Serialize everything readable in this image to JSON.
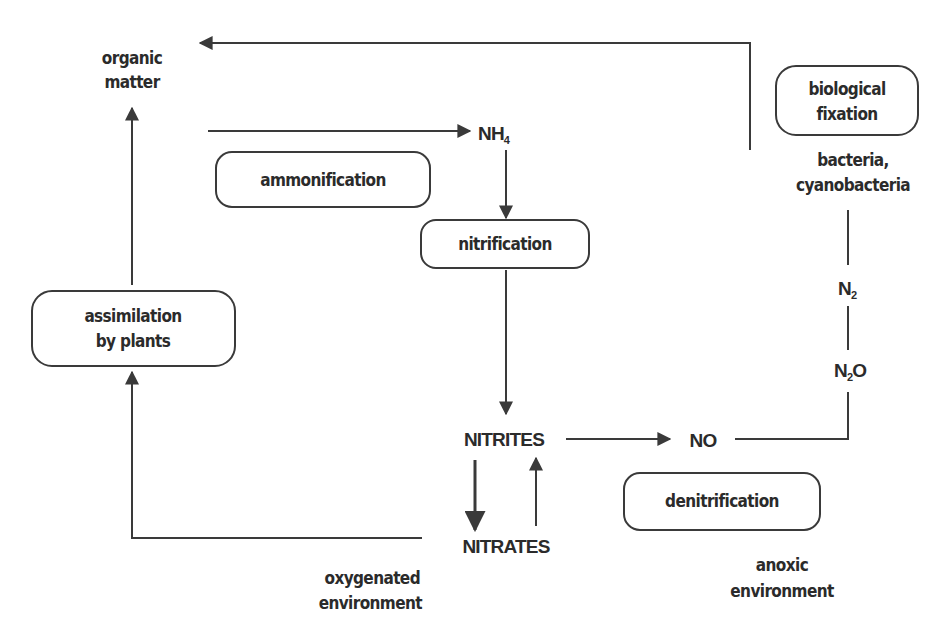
{
  "diagram": {
    "type": "nitrogen-cycle",
    "colors": {
      "ink": "#2b2b2b",
      "line": "#3a3a3a",
      "background": "#ffffff"
    },
    "nodes": {
      "organic_matter": {
        "line1": "organic",
        "line2": "matter"
      },
      "nh4": {
        "base": "NH",
        "subscript": "4"
      },
      "nitrites": {
        "label": "NITRITES"
      },
      "nitrates": {
        "label": "NITRATES"
      },
      "no": {
        "label": "NO"
      },
      "n2o": {
        "base": "N",
        "subscript": "2",
        "suffix": "O"
      },
      "n2": {
        "base": "N",
        "subscript": "2"
      },
      "bacteria": {
        "line1": "bacteria,",
        "line2": "cyanobacteria"
      }
    },
    "processes": {
      "ammonification": {
        "label": "ammonification"
      },
      "nitrification": {
        "label": "nitrification"
      },
      "assimilation": {
        "line1": "assimilation",
        "line2": "by plants"
      },
      "biological_fixation": {
        "line1": "biological",
        "line2": "fixation"
      },
      "denitrification": {
        "label": "denitrification"
      }
    },
    "environments": {
      "oxygenated": {
        "line1": "oxygenated",
        "line2": "environment"
      },
      "anoxic": {
        "line1": "anoxic",
        "line2": "environment"
      }
    },
    "edges": [
      {
        "from": "organic_matter",
        "to": "nh4",
        "via": "ammonification"
      },
      {
        "from": "nh4",
        "to": "nitrites",
        "via": "nitrification"
      },
      {
        "from": "nitrites",
        "to": "nitrates"
      },
      {
        "from": "nitrates",
        "to": "nitrites"
      },
      {
        "from": "nitrates",
        "to": "assimilation"
      },
      {
        "from": "assimilation",
        "to": "organic_matter"
      },
      {
        "from": "nitrites",
        "to": "no",
        "via": "denitrification"
      },
      {
        "from": "no",
        "to": "n2o"
      },
      {
        "from": "n2o",
        "to": "n2"
      },
      {
        "from": "n2",
        "to": "bacteria",
        "via": "biological_fixation"
      },
      {
        "from": "bacteria",
        "to": "organic_matter"
      }
    ]
  }
}
